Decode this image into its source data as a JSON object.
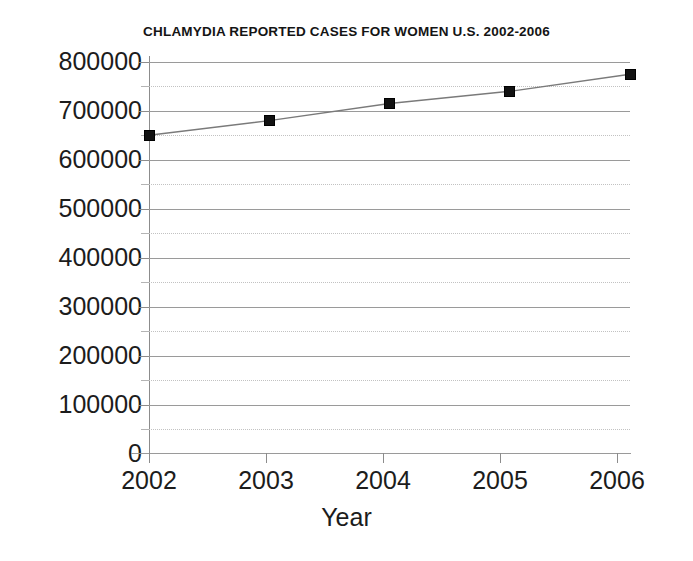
{
  "chart_data": {
    "type": "line",
    "title": "CHLAMYDIA REPORTED CASES FOR WOMEN U.S. 2002-2006",
    "xlabel": "Year",
    "ylabel": "",
    "categories": [
      "2002",
      "2003",
      "2004",
      "2005",
      "2006"
    ],
    "x": [
      2002,
      2003,
      2004,
      2005,
      2006
    ],
    "values": [
      650000,
      680000,
      715000,
      740000,
      775000
    ],
    "series": [
      {
        "name": "Chlamydia reported cases for women",
        "values": [
          650000,
          680000,
          715000,
          740000,
          775000
        ]
      }
    ],
    "ylim": [
      0,
      800000
    ],
    "xlim": [
      2002,
      2006
    ],
    "y_ticks": [
      0,
      100000,
      200000,
      300000,
      400000,
      500000,
      600000,
      700000,
      800000
    ],
    "y_tick_labels": [
      "0",
      "100000",
      "200000",
      "300000",
      "400000",
      "500000",
      "600000",
      "700000",
      "800000"
    ],
    "y_minor_ticks": [
      50000,
      150000,
      250000,
      350000,
      450000,
      550000,
      650000,
      750000
    ],
    "x_ticks": [
      2002,
      2003,
      2004,
      2005,
      2006
    ],
    "x_tick_labels": [
      "2002",
      "2003",
      "2004",
      "2005",
      "2006"
    ],
    "grid": "horizontal-major-solid-minor-dotted",
    "legend": "none",
    "marker": "square",
    "marker_color": "#121212",
    "line_color": "#7a7a7a",
    "background_color": "#ffffff",
    "grid_major_color": "#9a9a9a",
    "grid_minor_color": "#c2c2c2"
  },
  "axis": {
    "y_labels": [
      "800000",
      "700000",
      "600000",
      "500000",
      "400000",
      "300000",
      "200000",
      "100000",
      "0"
    ],
    "x_labels": [
      "2002",
      "2003",
      "2004",
      "2005",
      "2006"
    ],
    "x_title": "Year"
  }
}
